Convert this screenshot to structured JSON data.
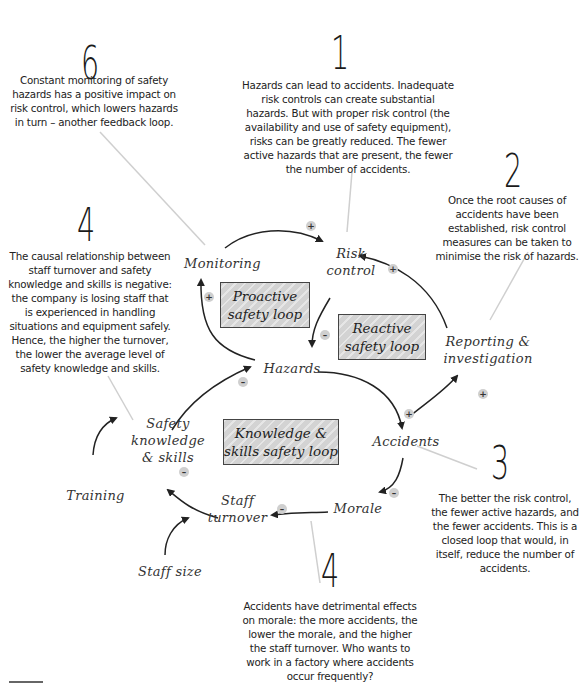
{
  "callouts": [
    {
      "number": "6",
      "text": "Constant monitoring of safety hazards has a positive impact on risk control, which lowers hazards in turn – another feedback loop."
    },
    {
      "number": "1",
      "text": "Hazards can lead to accidents. Inadequate risk controls can create substantial hazards. But with proper risk control (the availability and use of safety equipment), risks can be greatly reduced. The fewer active hazards that are present, the fewer the number of accidents."
    },
    {
      "number": "2",
      "text": "Once the root causes of accidents have been established, risk control measures can be taken to minimise the risk of hazards."
    },
    {
      "number": "5",
      "text": "The causal relationship between staff turnover and safety knowledge and skills is negative: the company is losing staff that is experienced in handling situations and equipment safely. Hence, the higher the turnover, the lower the average level of safety knowledge and skills."
    },
    {
      "number": "3",
      "text": "The better the risk control, the fewer active hazards, and the fewer accidents. This is a closed loop that would, in itself, reduce the number of accidents."
    },
    {
      "number": "4",
      "text": "Accidents have detrimental effects on morale: the more accidents, the lower the morale, and the higher the staff turnover. Who wants to work in a factory where accidents occur frequently?"
    }
  ],
  "nodes": {
    "monitoring": "Monitoring",
    "risk_control_1": "Risk",
    "risk_control_2": "control",
    "reporting_1": "Reporting &",
    "reporting_2": "investigation",
    "hazards": "Hazards",
    "accidents": "Accidents",
    "safety_knowledge_1": "Safety",
    "safety_knowledge_2": "knowledge",
    "safety_knowledge_3": "& skills",
    "training": "Training",
    "staff_turnover_1": "Staff",
    "staff_turnover_2": "turnover",
    "morale": "Morale",
    "staff_size": "Staff size"
  },
  "loops": {
    "proactive_1": "Proactive",
    "proactive_2": "safety loop",
    "reactive_1": "Reactive",
    "reactive_2": "safety loop",
    "knowledge_1": "Knowledge &",
    "knowledge_2": "skills safety loop"
  },
  "polarities": {
    "monitoring_to_risk": "+",
    "hazards_to_monitoring": "+",
    "risk_to_hazards": "–",
    "reporting_to_risk": "+",
    "accidents_to_reporting": "+",
    "hazards_to_accidents": "+",
    "accidents_to_morale": "–",
    "morale_to_turnover": "–",
    "turnover_to_knowledge": "–",
    "knowledge_to_hazards": "–"
  }
}
